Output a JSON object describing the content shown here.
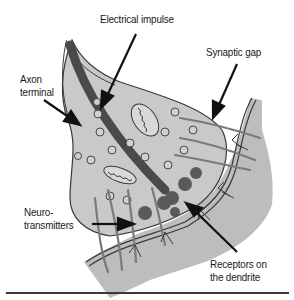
{
  "diagram": {
    "labels": {
      "electrical_impulse": "Electrical impulse",
      "synaptic_gap": "Synaptic gap",
      "axon_terminal": "Axon\nterminal",
      "neurotransmitters": "Neuro-\ntransmitters",
      "receptors": "Receptors on\nthe dendrite"
    },
    "colors": {
      "cell_fill": "#c9c9c9",
      "dendrite_fill": "#bdbdbd",
      "impulse_band": "#4a4a4a",
      "vesicle_fill": "#5a5a5a",
      "outline": "#3a3a3a",
      "background": "#ffffff"
    }
  }
}
